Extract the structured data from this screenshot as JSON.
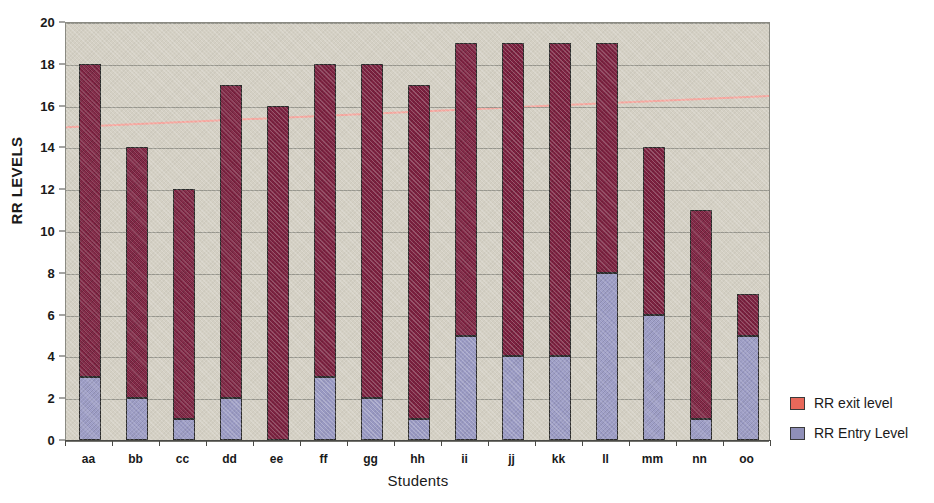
{
  "chart_data": {
    "type": "bar",
    "subtype": "stacked",
    "title": "",
    "xlabel": "Students",
    "ylabel": "RR LEVELS",
    "ylim": [
      0,
      20
    ],
    "ytick_step": 2,
    "ytick_labels": [
      "0",
      "2",
      "4",
      "6",
      "8",
      "10",
      "12",
      "14",
      "16",
      "18",
      "20"
    ],
    "grid": true,
    "legend_position": "right",
    "categories": [
      "aa",
      "bb",
      "cc",
      "dd",
      "ee",
      "ff",
      "gg",
      "hh",
      "ii",
      "jj",
      "kk",
      "ll",
      "mm",
      "nn",
      "oo"
    ],
    "series": [
      {
        "name": "RR Entry Level",
        "color": "#9a9ac4",
        "legend_swatch_color": "#8f8fb8",
        "values": [
          3,
          2,
          1,
          2,
          0,
          3,
          2,
          1,
          5,
          4,
          4,
          8,
          6,
          1,
          5
        ]
      },
      {
        "name": "RR exit level",
        "color": "#7d2140",
        "legend_swatch_color": "#e8685a",
        "values": [
          18,
          14,
          12,
          17,
          16,
          18,
          18,
          17,
          19,
          19,
          19,
          19,
          14,
          11,
          7
        ],
        "note": "values are bar totals (stacked top)"
      }
    ],
    "trendline": {
      "color": "#f7a8a0",
      "start_value": 15.0,
      "end_value": 16.5
    },
    "plot_background": "#d4d0c4"
  },
  "legend": {
    "items": [
      {
        "label": "RR exit level"
      },
      {
        "label": "RR Entry Level"
      }
    ]
  }
}
